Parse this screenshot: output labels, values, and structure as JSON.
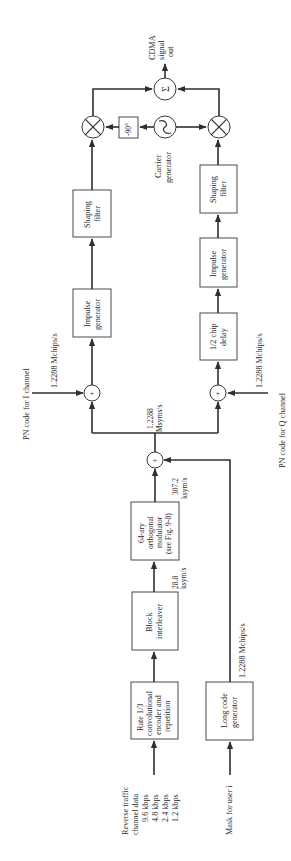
{
  "diagram": {
    "orientation": "rotated-90-ccw",
    "inputs": {
      "traffic": {
        "title_line1": "Reverse traffic",
        "title_line2": "channel data",
        "rates": [
          "9.6 kbps",
          "4.8 kbps",
          "2.4 kbps",
          "1.2 kbps"
        ]
      },
      "mask": {
        "label": "Mask for user i"
      },
      "pn_i": {
        "label": "PN code for I channel",
        "rate": "1.2288 Mchips/s"
      },
      "pn_q": {
        "label": "PN code for Q channel",
        "rate": "1.2288 Mchips/s"
      }
    },
    "blocks": {
      "encoder": {
        "line1": "Rate 1/3",
        "line2": "convolutional",
        "line3": "encoder and",
        "line4": "repetition"
      },
      "interleaver": {
        "line1": "Block",
        "line2": "interleaver"
      },
      "modulator": {
        "line1": "64-ary",
        "line2": "orthogonal",
        "line3": "modulator",
        "line4": "(see Fig. 9-8)"
      },
      "long_code": {
        "line1": "Long code",
        "line2": "generator"
      },
      "impulse_i": {
        "line1": "Impulse",
        "line2": "generator"
      },
      "shaping_i": {
        "line1": "Shaping",
        "line2": "filter"
      },
      "chip_delay": {
        "line1": "1/2 chip",
        "line2": "delay"
      },
      "impulse_q": {
        "line1": "Impulse",
        "line2": "generator"
      },
      "shaping_q": {
        "line1": "Shaping",
        "line2": "filter"
      },
      "phase_shift": {
        "label": "-90°"
      },
      "carrier": {
        "line1": "Carrier",
        "line2": "generator"
      }
    },
    "rates": {
      "after_interleaver": {
        "line1": "28.8",
        "line2": "ksym/s"
      },
      "after_modulator": {
        "line1": "307.2",
        "line2": "ksym/s"
      },
      "after_xor": {
        "line1": "1.2288",
        "line2": "Msyms/s"
      },
      "long_code_rate": "1.2288 Mchips/s"
    },
    "symbols": {
      "xor": "+",
      "sum": "Σ",
      "sine": "~"
    },
    "output": {
      "line1": "CDMA",
      "line2": "signal",
      "line3": "out"
    }
  }
}
